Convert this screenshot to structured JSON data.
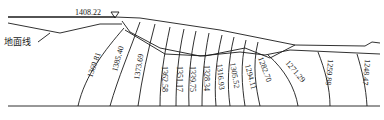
{
  "diagram": {
    "water_level_label": "1408.22",
    "ground_line_label": "地面线",
    "contour_labels": [
      "1369.81",
      "1385.40",
      "1373.69",
      "1362.58",
      "1351.17",
      "1339.75",
      "1328.34",
      "1316.93",
      "1305.52",
      "1294.11",
      "1282.70",
      "1271.29",
      "1259.88",
      "1248.47"
    ]
  }
}
